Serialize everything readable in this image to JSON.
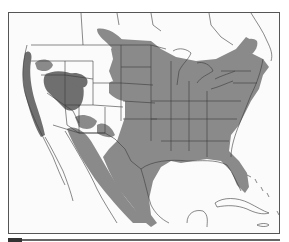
{
  "map": {
    "subject": "North America range distribution map",
    "legend_visible": false,
    "colors": {
      "background": "#fbfbfb",
      "range_primary": "#8a8a8a",
      "range_dense": "#6f6f6f",
      "borders": "#3a3a3a",
      "frame": "#555555"
    },
    "regions": [
      {
        "name": "eastern-united-states",
        "shade": "range_primary"
      },
      {
        "name": "great-plains",
        "shade": "range_primary"
      },
      {
        "name": "northeast-into-canada",
        "shade": "range_primary"
      },
      {
        "name": "pacific-coast",
        "shade": "range_dense"
      },
      {
        "name": "great-basin-nevada-utah",
        "shade": "range_dense"
      },
      {
        "name": "southwest-mexico-corridor",
        "shade": "range_primary"
      },
      {
        "name": "mexico-gulf-coast",
        "shade": "range_primary"
      },
      {
        "name": "florida",
        "shade": "range_primary"
      }
    ]
  }
}
